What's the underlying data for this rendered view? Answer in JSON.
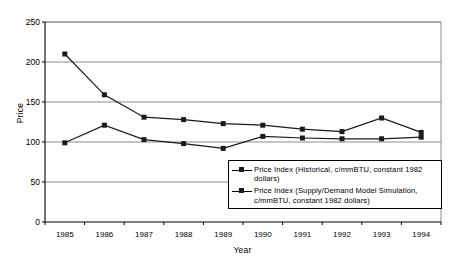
{
  "chart_data": {
    "type": "line",
    "title": "",
    "xlabel": "Year",
    "ylabel": "Price",
    "categories": [
      "1985",
      "1986",
      "1987",
      "1988",
      "1989",
      "1990",
      "1991",
      "1992",
      "1993",
      "1994"
    ],
    "xlim": [
      1985,
      1994
    ],
    "ylim": [
      0,
      250
    ],
    "yticks": [
      0,
      50,
      100,
      150,
      200,
      250
    ],
    "ytick_labels": [
      "0",
      "50",
      "100",
      "150",
      "200",
      "250"
    ],
    "grid": "horizontal",
    "legend_position": "inside-bottom-right",
    "series": [
      {
        "name": "Price Index (Historical, c/mmBTU, constant 1982 dollars)",
        "marker": "square",
        "color": "#1a1a1a",
        "values": [
          210,
          159,
          131,
          128,
          123,
          121,
          116,
          113,
          130,
          112
        ]
      },
      {
        "name": "Price Index (Supply/Demand Model Simulation, c/mmBTU, constant 1982 dollars)",
        "marker": "square",
        "color": "#1a1a1a",
        "values": [
          99,
          121,
          103,
          98,
          92,
          107,
          105,
          104,
          104,
          106
        ]
      }
    ]
  },
  "legend": {
    "entries": [
      {
        "label": "Price Index (Historical, c/mmBTU, constant 1982 dollars)"
      },
      {
        "label": "Price Index (Supply/Demand Model Simulation, c/mmBTU, constant 1982 dollars)"
      }
    ]
  }
}
